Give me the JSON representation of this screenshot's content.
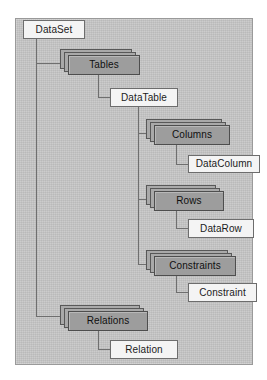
{
  "diagram": {
    "background_color": "#c6c6c6",
    "border_color": "#9a9a9a",
    "line_color": "#6f6f6f",
    "collection_fill": "#9d9d9d",
    "leaf_fill": "#f4f4f4",
    "nodes": [
      {
        "id": "dataset",
        "label": "DataSet",
        "kind": "leaf",
        "x": 23,
        "y": 20,
        "w": 62,
        "h": 19
      },
      {
        "id": "tables",
        "label": "Tables",
        "kind": "collection",
        "x": 60,
        "y": 49,
        "w": 72,
        "h": 20
      },
      {
        "id": "datatable",
        "label": "DataTable",
        "kind": "leaf",
        "x": 110,
        "y": 88,
        "w": 68,
        "h": 19
      },
      {
        "id": "columns",
        "label": "Columns",
        "kind": "collection",
        "x": 146,
        "y": 119,
        "w": 76,
        "h": 20
      },
      {
        "id": "datacolumn",
        "label": "DataColumn",
        "kind": "leaf",
        "x": 188,
        "y": 155,
        "w": 72,
        "h": 18
      },
      {
        "id": "rows",
        "label": "Rows",
        "kind": "collection",
        "x": 146,
        "y": 185,
        "w": 70,
        "h": 20
      },
      {
        "id": "datarow",
        "label": "DataRow",
        "kind": "leaf",
        "x": 188,
        "y": 219,
        "w": 66,
        "h": 19
      },
      {
        "id": "constraints",
        "label": "Constraints",
        "kind": "collection",
        "x": 146,
        "y": 250,
        "w": 82,
        "h": 20
      },
      {
        "id": "constraint",
        "label": "Constraint",
        "kind": "leaf",
        "x": 188,
        "y": 283,
        "w": 69,
        "h": 19
      },
      {
        "id": "relations",
        "label": "Relations",
        "kind": "collection",
        "x": 60,
        "y": 305,
        "w": 80,
        "h": 20
      },
      {
        "id": "relation",
        "label": "Relation",
        "kind": "leaf",
        "x": 110,
        "y": 340,
        "w": 68,
        "h": 19
      }
    ],
    "edges": [
      {
        "from": "dataset",
        "to": "tables"
      },
      {
        "from": "dataset",
        "to": "relations"
      },
      {
        "from": "tables",
        "to": "datatable"
      },
      {
        "from": "datatable",
        "to": "columns"
      },
      {
        "from": "datatable",
        "to": "rows"
      },
      {
        "from": "datatable",
        "to": "constraints"
      },
      {
        "from": "columns",
        "to": "datacolumn"
      },
      {
        "from": "rows",
        "to": "datarow"
      },
      {
        "from": "constraints",
        "to": "constraint"
      },
      {
        "from": "relations",
        "to": "relation"
      }
    ]
  }
}
